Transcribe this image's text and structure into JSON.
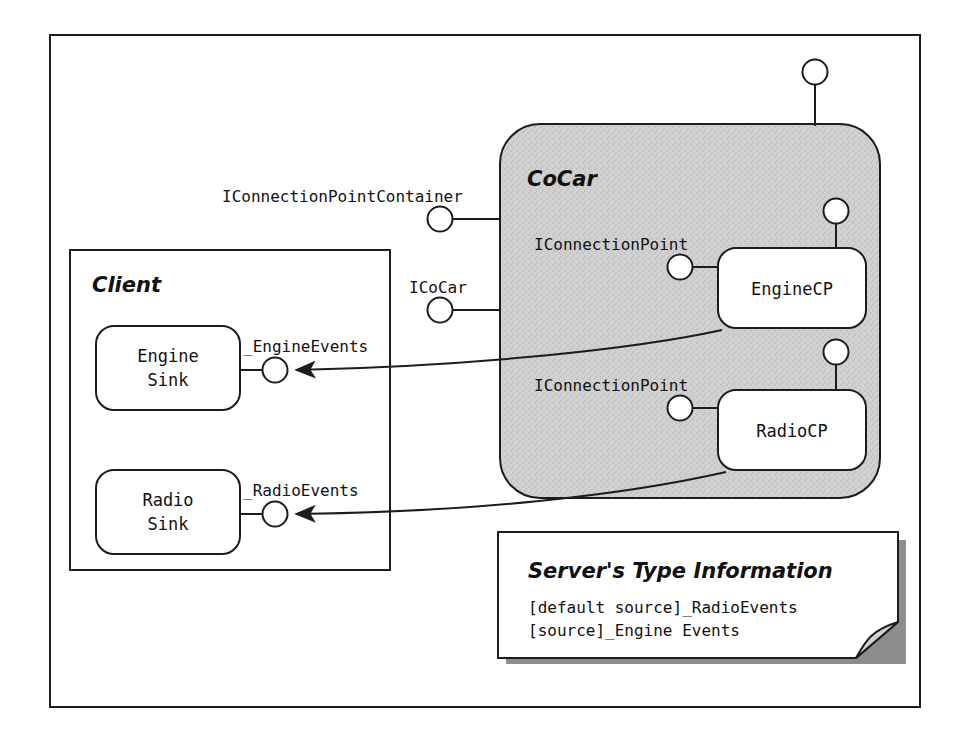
{
  "diagram": {
    "outer_frame": {
      "name": "figure-border"
    },
    "client": {
      "title": "Client",
      "sinks": [
        {
          "label_line1": "Engine",
          "label_line2": "Sink",
          "interface_label": "_EngineEvents"
        },
        {
          "label_line1": "Radio",
          "label_line2": "Sink",
          "interface_label": "_RadioEvents"
        }
      ]
    },
    "cocar": {
      "title": "CoCar",
      "outer_interfaces": [
        {
          "label": "IConnectionPointContainer"
        },
        {
          "label": "ICoCar"
        }
      ],
      "connection_points": [
        {
          "label": "EngineCP",
          "interface_label": "IConnectionPoint"
        },
        {
          "label": "RadioCP",
          "interface_label": "IConnectionPoint"
        }
      ],
      "top_lollipop": {
        "name": "unlabeled-interface-lollipop"
      }
    },
    "note": {
      "title": "Server's Type Information",
      "lines": [
        "[default source]_RadioEvents",
        "[source]_Engine Events"
      ]
    },
    "colors": {
      "stroke": "#1c1c1c",
      "cocar_fill": "#d2d2d2",
      "note_shadow": "#8d8d8d",
      "paper": "#ffffff"
    }
  }
}
